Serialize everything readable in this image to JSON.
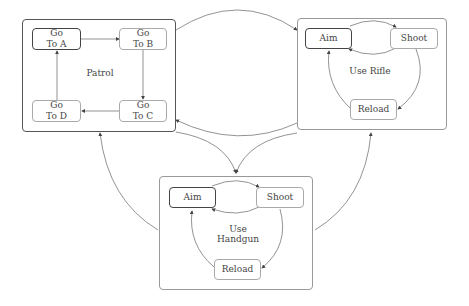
{
  "groups": {
    "patrol": {
      "label": "Patrol",
      "states": {
        "a": "Go\nTo A",
        "b": "Go\nTo B",
        "c": "Go\nTo C",
        "d": "Go\nTo D"
      }
    },
    "rifle": {
      "label": "Use Rifle",
      "states": {
        "aim": "Aim",
        "shoot": "Shoot",
        "reload": "Reload"
      }
    },
    "handgun": {
      "label": "Use Handgun",
      "states": {
        "aim": "Aim",
        "shoot": "Shoot",
        "reload": "Reload"
      }
    }
  },
  "colors": {
    "line": "#666666",
    "border": "#999999",
    "initial_border": "#444444"
  }
}
